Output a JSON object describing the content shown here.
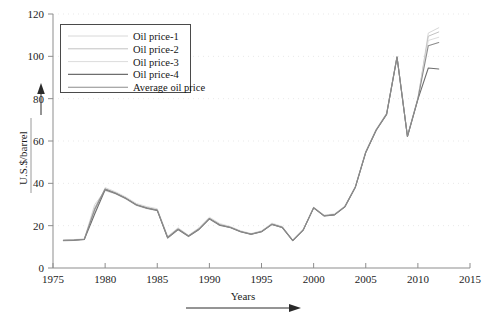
{
  "chart_data": {
    "type": "line",
    "title": "",
    "xlabel": "Years",
    "ylabel": "U.S.$/barrel",
    "xlim": [
      1975,
      2015
    ],
    "ylim": [
      0,
      120
    ],
    "xticks": [
      "1975",
      "1980",
      "1985",
      "1990",
      "1995",
      "2000",
      "2005",
      "2010",
      "2015"
    ],
    "yticks": [
      "0",
      "20",
      "40",
      "60",
      "80",
      "100",
      "120"
    ],
    "grid": "horizontal-dotted",
    "legend_position": "upper-left-inside",
    "x": [
      1976,
      1977,
      1978,
      1979,
      1980,
      1981,
      1982,
      1983,
      1984,
      1985,
      1986,
      1987,
      1988,
      1989,
      1990,
      1991,
      1992,
      1993,
      1994,
      1995,
      1996,
      1997,
      1998,
      1999,
      2000,
      2001,
      2002,
      2003,
      2004,
      2005,
      2006,
      2007,
      2008,
      2009,
      2010,
      2011,
      2012
    ],
    "series": [
      {
        "name": "Oil price-1",
        "color": "#d8d8d8",
        "width": 1.0,
        "values": [
          13.0,
          13.2,
          13.6,
          30.0,
          36.5,
          35.0,
          32.5,
          29.5,
          28.0,
          27.0,
          14.0,
          18.0,
          14.8,
          18.0,
          23.0,
          20.0,
          19.0,
          17.0,
          15.8,
          17.0,
          20.5,
          19.0,
          12.8,
          17.8,
          28.3,
          24.5,
          25.0,
          28.8,
          38.0,
          54.5,
          65.0,
          72.5,
          99.5,
          62.0,
          79.5,
          111.0,
          113.5
        ]
      },
      {
        "name": "Oil price-2",
        "color": "#c2c2c2",
        "width": 1.0,
        "values": [
          12.8,
          13.0,
          13.4,
          28.5,
          37.5,
          35.5,
          33.0,
          30.0,
          28.5,
          27.5,
          14.5,
          18.5,
          15.2,
          18.5,
          23.5,
          20.5,
          19.3,
          17.3,
          16.0,
          17.3,
          20.8,
          19.3,
          13.0,
          18.0,
          28.5,
          24.8,
          25.3,
          29.0,
          38.3,
          54.8,
          65.3,
          72.8,
          99.8,
          62.3,
          80.0,
          109.5,
          111.5
        ]
      },
      {
        "name": "Oil price-3",
        "color": "#dcdcdc",
        "width": 1.0,
        "values": [
          13.2,
          13.4,
          13.8,
          26.5,
          38.0,
          36.0,
          33.5,
          30.5,
          29.0,
          28.0,
          15.0,
          19.0,
          15.5,
          19.0,
          24.0,
          21.0,
          19.6,
          17.6,
          16.3,
          17.6,
          21.2,
          19.6,
          13.2,
          18.2,
          28.8,
          25.0,
          25.6,
          29.3,
          38.6,
          55.2,
          65.6,
          73.2,
          100.0,
          62.6,
          80.5,
          107.5,
          109.0
        ]
      },
      {
        "name": "Oil price-4",
        "color": "#6e6e6e",
        "width": 1.1,
        "values": [
          13.1,
          13.1,
          13.5,
          25.5,
          37.0,
          35.2,
          32.8,
          29.8,
          28.2,
          27.2,
          14.2,
          18.2,
          15.0,
          18.2,
          23.2,
          20.2,
          19.1,
          17.1,
          15.9,
          17.1,
          20.6,
          19.1,
          12.9,
          17.9,
          28.4,
          24.6,
          25.1,
          28.9,
          38.1,
          54.6,
          65.1,
          72.6,
          99.6,
          62.1,
          79.7,
          94.5,
          94.0
        ]
      },
      {
        "name": "Average oil price",
        "color": "#8c8c8c",
        "width": 1.1,
        "values": [
          13.0,
          13.2,
          13.6,
          27.6,
          37.3,
          35.4,
          32.9,
          29.9,
          28.4,
          27.4,
          14.4,
          18.4,
          15.1,
          18.4,
          23.4,
          20.4,
          19.2,
          17.2,
          16.0,
          17.2,
          20.7,
          19.2,
          13.0,
          18.0,
          28.5,
          24.7,
          25.2,
          29.0,
          38.2,
          54.7,
          65.2,
          72.7,
          99.7,
          62.2,
          79.9,
          105.0,
          106.5
        ]
      }
    ]
  },
  "legend": {
    "entries": [
      {
        "label": "Oil price-1"
      },
      {
        "label": "Oil price-2"
      },
      {
        "label": "Oil price-3"
      },
      {
        "label": "Oil price-4"
      },
      {
        "label": "Average oil price"
      }
    ]
  },
  "axes": {
    "y_axis_label": "U.S.$/barrel",
    "x_axis_label": "Years"
  }
}
